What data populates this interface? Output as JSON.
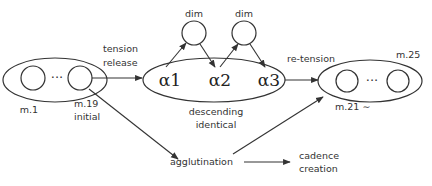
{
  "diagram": {
    "colors": {
      "stroke": "#333333",
      "text": "#333333",
      "background": "#ffffff"
    },
    "groups": {
      "initial": {
        "first_label": "m.1",
        "last_label": "m.19",
        "sub_label": "initial",
        "ellipsis": "···"
      },
      "descending": {
        "nodes": [
          "α1",
          "α2",
          "α3"
        ],
        "label_line1": "descending",
        "label_line2": "identical",
        "dim_nodes": [
          "dim",
          "dim"
        ]
      },
      "final": {
        "first_label": "m.21 ∼",
        "last_label": "m.25",
        "ellipsis": "···"
      }
    },
    "edges": {
      "tension_release_line1": "tension",
      "tension_release_line2": "release",
      "re_tension": "re-tension"
    },
    "bottom": {
      "agglutination": "agglutination",
      "cadence_line1": "cadence",
      "cadence_line2": "creation"
    }
  }
}
